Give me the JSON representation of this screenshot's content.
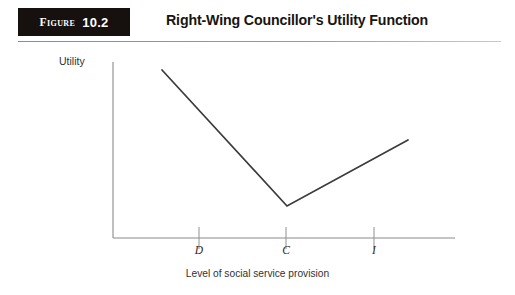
{
  "figure": {
    "badge_word": "Figure",
    "badge_number": "10.2",
    "title": "Right-Wing Councillor's Utility Function"
  },
  "chart_data": {
    "type": "line",
    "title": "Right-Wing Councillor's Utility Function",
    "xlabel": "Level of social service provision",
    "ylabel": "Utility",
    "grid": false,
    "legend": null,
    "axis_tick_labels": {
      "x": [
        "D",
        "C",
        "I"
      ],
      "y": []
    },
    "x_tick_positions": [
      199,
      286,
      374
    ],
    "series": [
      {
        "name": "Utility",
        "points": [
          {
            "x": 162,
            "y": 70
          },
          {
            "x": 287,
            "y": 206
          },
          {
            "x": 408,
            "y": 140
          }
        ],
        "shape": "v-shaped",
        "description": "Utility falls steeply from a high level as social service provision rises to point C, then rises again beyond C"
      }
    ],
    "axes": {
      "y_axis_x": 113,
      "y_axis_top": 62,
      "y_axis_bottom": 238,
      "x_axis_y": 238,
      "x_axis_left": 113,
      "x_axis_right": 455
    },
    "annotations": [
      {
        "label": "D",
        "x": 199,
        "meaning": "tick on horizontal axis"
      },
      {
        "label": "C",
        "x": 286,
        "meaning": "tick on horizontal axis, aligned with minimum of utility curve"
      },
      {
        "label": "I",
        "x": 374,
        "meaning": "tick on horizontal axis"
      }
    ]
  },
  "colors": {
    "badge_background": "#16110f",
    "badge_text": "#ffffff",
    "title_text": "#18140f",
    "axis_line": "#8a8a8a",
    "curve_line": "#3b3b3b",
    "page_background": "#ffffff"
  }
}
